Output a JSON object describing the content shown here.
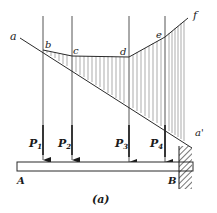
{
  "figure": {
    "caption": "(a)",
    "line_labels": {
      "start": "a",
      "end": "a'"
    },
    "polygon_points": [
      {
        "label": "b"
      },
      {
        "label": "c"
      },
      {
        "label": "d"
      },
      {
        "label": "e"
      },
      {
        "label": "f"
      }
    ],
    "loads": [
      {
        "label": "P",
        "sub": "1"
      },
      {
        "label": "P",
        "sub": "2"
      },
      {
        "label": "P",
        "sub": "3"
      },
      {
        "label": "P",
        "sub": "4"
      }
    ],
    "supports": {
      "left": "A",
      "right": "B"
    },
    "colors": {
      "line": "#2a2a2a",
      "hatch": "#555555",
      "background": "#ffffff"
    }
  }
}
